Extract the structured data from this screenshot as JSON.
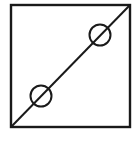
{
  "diagram": {
    "canvas": {
      "width": 136,
      "height": 152,
      "background": "#ffffff"
    },
    "stroke_color": "#1a1a1a",
    "frame": {
      "x": 11,
      "y": 5,
      "width": 119,
      "height": 122,
      "stroke_width": 2.4
    },
    "diagonal": {
      "x1": 11,
      "y1": 127,
      "x2": 130,
      "y2": 5,
      "stroke_width": 2
    },
    "circles": [
      {
        "name": "upper-circle",
        "cx": 100,
        "cy": 35,
        "r": 10.5,
        "stroke_width": 2
      },
      {
        "name": "lower-circle",
        "cx": 41,
        "cy": 96,
        "r": 10.5,
        "stroke_width": 2
      }
    ]
  }
}
